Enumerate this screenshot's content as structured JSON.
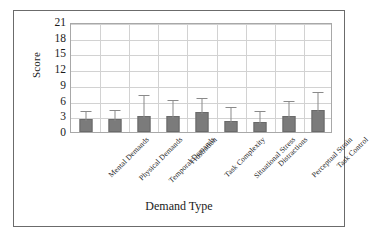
{
  "chart_data": {
    "type": "bar",
    "title": "",
    "xlabel": "Demand Type",
    "ylabel": "Score",
    "ylim": [
      0,
      21
    ],
    "yticks": [
      0,
      3,
      6,
      9,
      12,
      15,
      18,
      21
    ],
    "grid": true,
    "legend": false,
    "categories": [
      "Mental Demands",
      "Physical Demands",
      "Temporal Demands",
      "Frustration",
      "Task Complexity",
      "Situational Stress",
      "Distractions",
      "Perceptual Strain",
      "Task Control"
    ],
    "values": [
      2.4,
      2.5,
      3.0,
      3.0,
      3.8,
      2.1,
      1.9,
      3.1,
      4.2
    ],
    "error_upper": [
      4.3,
      4.6,
      7.4,
      6.5,
      6.9,
      5.1,
      4.3,
      6.3,
      8.0
    ],
    "error_bars": "upper-only",
    "bar_color": "#7b7b7b",
    "bar_edge_color": "#6a6a6a",
    "error_color": "#8a8a8a",
    "grid_color": "#d2d2d2",
    "axis_color": "#a8a8a8",
    "frame_color": "#6b6b6b",
    "text_color": "#1a1a1a"
  }
}
